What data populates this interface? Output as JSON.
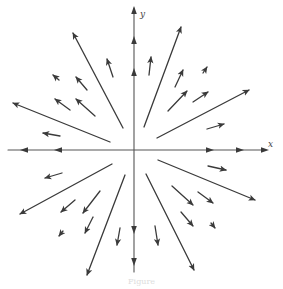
{
  "figure": {
    "type": "vector-field",
    "caption": "Figure",
    "stroke_color": "#3a3a3a",
    "axis_color": "#555555",
    "origin": [
      134,
      150
    ],
    "axes": {
      "x_label": "x",
      "y_label": "y",
      "x_axis": {
        "from": [
          8,
          150
        ],
        "to": [
          266,
          150
        ]
      },
      "y_axis": {
        "from": [
          134,
          272
        ],
        "to": [
          134,
          8
        ]
      },
      "x_arrowheads": [
        {
          "at": [
            24,
            150
          ],
          "dir": "left"
        },
        {
          "at": [
            58,
            150
          ],
          "dir": "left"
        },
        {
          "at": [
            210,
            150
          ],
          "dir": "right"
        },
        {
          "at": [
            240,
            150
          ],
          "dir": "right"
        },
        {
          "at": [
            265,
            150
          ],
          "dir": "right"
        }
      ],
      "y_arrowheads": [
        {
          "at": [
            134,
            10
          ],
          "dir": "up"
        },
        {
          "at": [
            134,
            40
          ],
          "dir": "up"
        },
        {
          "at": [
            134,
            72
          ],
          "dir": "up"
        },
        {
          "at": [
            134,
            230
          ],
          "dir": "down"
        },
        {
          "at": [
            134,
            262
          ],
          "dir": "down"
        }
      ]
    },
    "vectors": [
      {
        "quadrant": "upper-left",
        "from": [
          123,
          128
        ],
        "to": [
          73,
          33
        ]
      },
      {
        "quadrant": "upper-left",
        "from": [
          110,
          142
        ],
        "to": [
          13,
          103
        ]
      },
      {
        "quadrant": "upper-left",
        "from": [
          113,
          77
        ],
        "to": [
          107,
          59
        ]
      },
      {
        "quadrant": "upper-left",
        "from": [
          87,
          90
        ],
        "to": [
          76,
          77
        ]
      },
      {
        "quadrant": "upper-left",
        "from": [
          95,
          116
        ],
        "to": [
          76,
          99
        ]
      },
      {
        "quadrant": "upper-left",
        "from": [
          70,
          110
        ],
        "to": [
          55,
          99
        ]
      },
      {
        "quadrant": "upper-left",
        "from": [
          59,
          80
        ],
        "to": [
          53,
          75
        ]
      },
      {
        "quadrant": "upper-left",
        "from": [
          60,
          136
        ],
        "to": [
          43,
          133
        ]
      },
      {
        "quadrant": "upper-right",
        "from": [
          144,
          127
        ],
        "to": [
          181,
          27
        ]
      },
      {
        "quadrant": "upper-right",
        "from": [
          157,
          138
        ],
        "to": [
          249,
          90
        ]
      },
      {
        "quadrant": "upper-right",
        "from": [
          149,
          75
        ],
        "to": [
          151,
          57
        ]
      },
      {
        "quadrant": "upper-right",
        "from": [
          175,
          87
        ],
        "to": [
          183,
          70
        ]
      },
      {
        "quadrant": "upper-right",
        "from": [
          168,
          111
        ],
        "to": [
          187,
          91
        ]
      },
      {
        "quadrant": "upper-right",
        "from": [
          193,
          102
        ],
        "to": [
          208,
          92
        ]
      },
      {
        "quadrant": "upper-right",
        "from": [
          203,
          73
        ],
        "to": [
          207,
          67
        ]
      },
      {
        "quadrant": "upper-right",
        "from": [
          207,
          129
        ],
        "to": [
          224,
          124
        ]
      },
      {
        "quadrant": "lower-left",
        "from": [
          112,
          164
        ],
        "to": [
          20,
          214
        ]
      },
      {
        "quadrant": "lower-left",
        "from": [
          125,
          175
        ],
        "to": [
          87,
          275
        ]
      },
      {
        "quadrant": "lower-left",
        "from": [
          62,
          173
        ],
        "to": [
          45,
          178
        ]
      },
      {
        "quadrant": "lower-left",
        "from": [
          75,
          200
        ],
        "to": [
          61,
          212
        ]
      },
      {
        "quadrant": "lower-left",
        "from": [
          100,
          191
        ],
        "to": [
          83,
          213
        ]
      },
      {
        "quadrant": "lower-left",
        "from": [
          93,
          217
        ],
        "to": [
          85,
          233
        ]
      },
      {
        "quadrant": "lower-left",
        "from": [
          63,
          231
        ],
        "to": [
          59,
          236
        ]
      },
      {
        "quadrant": "lower-left",
        "from": [
          120,
          228
        ],
        "to": [
          117,
          245
        ]
      },
      {
        "quadrant": "lower-right",
        "from": [
          158,
          160
        ],
        "to": [
          255,
          200
        ]
      },
      {
        "quadrant": "lower-right",
        "from": [
          146,
          174
        ],
        "to": [
          194,
          270
        ]
      },
      {
        "quadrant": "lower-right",
        "from": [
          208,
          166
        ],
        "to": [
          226,
          170
        ]
      },
      {
        "quadrant": "lower-right",
        "from": [
          172,
          186
        ],
        "to": [
          193,
          205
        ]
      },
      {
        "quadrant": "lower-right",
        "from": [
          198,
          192
        ],
        "to": [
          213,
          203
        ]
      },
      {
        "quadrant": "lower-right",
        "from": [
          181,
          212
        ],
        "to": [
          193,
          226
        ]
      },
      {
        "quadrant": "lower-right",
        "from": [
          211,
          223
        ],
        "to": [
          215,
          228
        ]
      },
      {
        "quadrant": "lower-right",
        "from": [
          155,
          226
        ],
        "to": [
          158,
          245
        ]
      }
    ]
  }
}
